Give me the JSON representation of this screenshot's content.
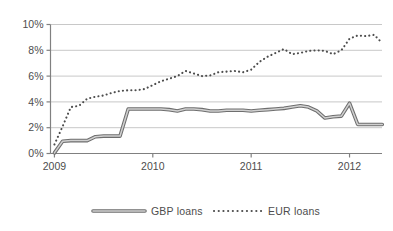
{
  "chart_data": {
    "type": "line",
    "title": "",
    "xlabel": "",
    "ylabel": "",
    "ylim": [
      0,
      10
    ],
    "xlim": [
      2008.96,
      2012.33
    ],
    "grid": true,
    "y_ticks": [
      "0%",
      "2%",
      "4%",
      "6%",
      "8%",
      "10%"
    ],
    "y_tick_values": [
      0,
      2,
      4,
      6,
      8,
      10
    ],
    "x_ticks": [
      "2009",
      "2010",
      "2011",
      "2012"
    ],
    "x_tick_values": [
      2009,
      2010,
      2011,
      2012
    ],
    "legend_position": "bottom",
    "series": [
      {
        "name": "GBP loans",
        "style": "solid",
        "color": "#6e6e6e",
        "x": [
          2009.0,
          2009.083,
          2009.167,
          2009.25,
          2009.333,
          2009.417,
          2009.5,
          2009.583,
          2009.667,
          2009.75,
          2010.0,
          2010.083,
          2010.167,
          2010.25,
          2010.333,
          2010.417,
          2010.5,
          2010.583,
          2010.667,
          2010.75,
          2010.833,
          2010.917,
          2011.0,
          2011.083,
          2011.167,
          2011.25,
          2011.333,
          2011.417,
          2011.5,
          2011.583,
          2011.667,
          2011.75,
          2011.833,
          2011.917,
          2012.0,
          2012.083,
          2012.167,
          2012.25,
          2012.333
        ],
        "values": [
          0.05,
          0.95,
          1.0,
          1.0,
          1.0,
          1.3,
          1.35,
          1.35,
          1.35,
          3.45,
          3.45,
          3.45,
          3.4,
          3.3,
          3.45,
          3.45,
          3.4,
          3.3,
          3.3,
          3.35,
          3.35,
          3.35,
          3.3,
          3.35,
          3.4,
          3.45,
          3.5,
          3.6,
          3.7,
          3.6,
          3.3,
          2.75,
          2.85,
          2.9,
          3.9,
          2.25,
          2.25,
          2.25,
          2.25
        ]
      },
      {
        "name": "EUR loans",
        "style": "dotted",
        "color": "#4d4d4d",
        "x": [
          2009.0,
          2009.083,
          2009.167,
          2009.25,
          2009.333,
          2009.417,
          2009.5,
          2009.583,
          2009.667,
          2009.75,
          2009.833,
          2009.917,
          2010.0,
          2010.083,
          2010.167,
          2010.25,
          2010.333,
          2010.417,
          2010.5,
          2010.583,
          2010.667,
          2010.75,
          2010.833,
          2010.917,
          2011.0,
          2011.083,
          2011.167,
          2011.25,
          2011.333,
          2011.417,
          2011.5,
          2011.583,
          2011.667,
          2011.75,
          2011.833,
          2011.917,
          2012.0,
          2012.083,
          2012.167,
          2012.25,
          2012.333
        ],
        "values": [
          0.7,
          2.1,
          3.6,
          3.7,
          4.25,
          4.4,
          4.5,
          4.7,
          4.85,
          4.9,
          4.9,
          5.0,
          5.3,
          5.6,
          5.8,
          6.0,
          6.4,
          6.2,
          6.0,
          6.05,
          6.3,
          6.35,
          6.4,
          6.3,
          6.5,
          7.1,
          7.5,
          7.8,
          8.1,
          7.7,
          7.8,
          7.95,
          8.0,
          7.95,
          7.7,
          8.0,
          8.9,
          9.15,
          9.1,
          9.2,
          8.55
        ]
      }
    ]
  },
  "legend": {
    "items": [
      {
        "label": "GBP loans",
        "marker": "solid-line"
      },
      {
        "label": "EUR loans",
        "marker": "dotted-line"
      }
    ]
  },
  "colors": {
    "axis": "#808080",
    "grid": "#c8c8c8",
    "gbp_line": "#6e6e6e",
    "gbp_fill": "#d0d0d0",
    "eur_dots": "#4d4d4d",
    "text": "#4d4d4d",
    "background": "#ffffff"
  }
}
